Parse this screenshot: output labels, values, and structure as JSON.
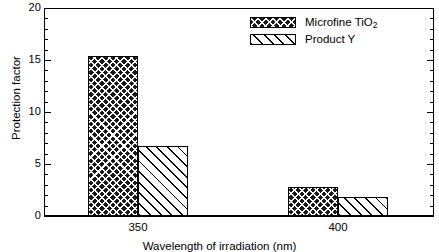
{
  "chart_data": {
    "type": "bar",
    "title": "",
    "categories": [
      "350",
      "400"
    ],
    "series": [
      {
        "name": "Microfine TiO2",
        "display_name": "Microfine TiO",
        "subscript": "2",
        "pattern": "crosshatch",
        "values": [
          15.4,
          2.8
        ]
      },
      {
        "name": "Product Y",
        "display_name": "Product Y",
        "subscript": "",
        "pattern": "diagonal-hatch",
        "values": [
          6.7,
          1.8
        ]
      }
    ],
    "xlabel": "Wavelength of irradiation (nm)",
    "ylabel": "Protection factor",
    "ylim": [
      0,
      20
    ],
    "y_major_ticks": [
      0,
      5,
      10,
      15,
      20
    ],
    "y_minor_tick_interval": 1,
    "grid": false,
    "legend_position": "top-right",
    "frame": "box",
    "tick_direction": "in"
  },
  "axes": {
    "y_tick_labels": [
      "0",
      "5",
      "10",
      "15",
      "20"
    ],
    "x_tick_labels": [
      "350",
      "400"
    ],
    "y_title": "Protection factor",
    "x_title": "Wavelength of irradiation (nm)"
  },
  "legend": {
    "entries": [
      {
        "label_main": "Microfine TiO",
        "label_sub": "2"
      },
      {
        "label_main": "Product Y",
        "label_sub": ""
      }
    ]
  },
  "colors": {
    "background": "#ffffff",
    "axis": "#000000",
    "series_1_fill": "#1a1a1a",
    "series_2_fill": "#ffffff",
    "hatch": "#000000"
  }
}
